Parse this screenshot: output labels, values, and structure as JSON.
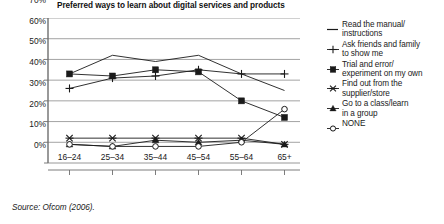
{
  "title": "Preferred ways to learn about digital services and products",
  "source": "Source: Ofcom (2006).",
  "axis": {
    "y_ticks": [
      "70%",
      "60%",
      "50%",
      "40%",
      "30%",
      "20%",
      "10%",
      "0%"
    ],
    "x_ticks": [
      "16–24",
      "25–34",
      "35–44",
      "45–54",
      "55–64",
      "65+"
    ]
  },
  "legend": [
    {
      "label": "Read the manual/\ninstructions",
      "marker": "line",
      "line1": "Read the manual/",
      "line2": "instructions"
    },
    {
      "label": "Ask friends and family\nto show me",
      "marker": "plus",
      "line1": "Ask friends and family",
      "line2": "to show me"
    },
    {
      "label": "Trial and error/\nexperiment on my own",
      "marker": "square",
      "line1": "Trial and error/",
      "line2": "experiment on my own"
    },
    {
      "label": "Find out from the\nsupplier/store",
      "marker": "cross",
      "line1": "Find out from the",
      "line2": "supplier/store"
    },
    {
      "label": "Go to a class/learn\nin a group",
      "marker": "triangle",
      "line1": "Go to a class/learn",
      "line2": "in a group"
    },
    {
      "label": "NONE",
      "marker": "circle",
      "line1": "NONE",
      "line2": ""
    }
  ],
  "colors": {
    "series": "#1a1a1a",
    "grid": "#8c8c8c",
    "axis": "#6e6e6e",
    "text": "#1a1a1a"
  },
  "chart_data": {
    "type": "line",
    "title": "Preferred ways to learn about digital services and products",
    "xlabel": "",
    "ylabel": "",
    "ylim": [
      0,
      70
    ],
    "ytick_step": 10,
    "grid": true,
    "legend_position": "right",
    "categories": [
      "16–24",
      "25–34",
      "35–44",
      "45–54",
      "55–64",
      "65+"
    ],
    "series": [
      {
        "name": "Read the manual/instructions",
        "marker": "none",
        "values": [
          43,
          52,
          49,
          52,
          43,
          35
        ]
      },
      {
        "name": "Ask friends and family to show me",
        "marker": "plus",
        "values": [
          36,
          41,
          42,
          45,
          43,
          43
        ]
      },
      {
        "name": "Trial and error/experiment on my own",
        "marker": "square",
        "values": [
          43,
          42,
          45,
          44,
          30,
          22
        ]
      },
      {
        "name": "Find out from the supplier/store",
        "marker": "cross",
        "values": [
          12,
          12,
          12,
          12,
          12,
          9
        ]
      },
      {
        "name": "Go to a class/learn in a group",
        "marker": "triangle",
        "values": [
          9,
          8,
          11,
          10,
          11,
          9
        ]
      },
      {
        "name": "NONE",
        "marker": "circle",
        "values": [
          9,
          8,
          8,
          8,
          10,
          26
        ]
      }
    ]
  }
}
